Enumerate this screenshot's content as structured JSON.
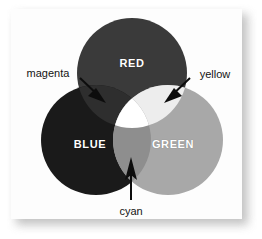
{
  "figure": {
    "background_color": "#ffffff",
    "panel_color": "#fdfdfd",
    "shadow_color": "#b9b9b9",
    "label_text_color": "#ffffff",
    "callout_text_color": "#141414",
    "arrow_color": "#0d0d0d"
  },
  "circles": [
    {
      "name": "red-circle",
      "label": "RED",
      "color": "#3a3a3a",
      "cx": 132,
      "cy": 73,
      "r": 55,
      "label_x": 132,
      "label_y": 63
    },
    {
      "name": "blue-circle",
      "label": "BLUE",
      "color": "#1a1a1a",
      "cx": 96,
      "cy": 140,
      "r": 55,
      "label_x": 90,
      "label_y": 144
    },
    {
      "name": "green-circle",
      "label": "GREEN",
      "color": "#a8a8a8",
      "cx": 168,
      "cy": 140,
      "r": 55,
      "label_x": 173,
      "label_y": 144
    }
  ],
  "overlaps": [
    {
      "name": "magenta-overlap",
      "label": "magenta",
      "components": [
        "RED",
        "BLUE"
      ],
      "color": "#2e2e2e",
      "label_x": 48,
      "label_y": 73
    },
    {
      "name": "yellow-overlap",
      "label": "yellow",
      "components": [
        "RED",
        "GREEN"
      ],
      "color": "#ededed",
      "label_x": 215,
      "label_y": 74
    },
    {
      "name": "cyan-overlap",
      "label": "cyan",
      "components": [
        "BLUE",
        "GREEN"
      ],
      "color": "#8e8e8e",
      "label_x": 131,
      "label_y": 211
    },
    {
      "name": "center-overlap",
      "label": "",
      "components": [
        "RED",
        "GREEN",
        "BLUE"
      ],
      "color": "#ffffff",
      "label_x": 0,
      "label_y": 0
    }
  ],
  "callouts": [
    {
      "name": "magenta-callout",
      "label": "magenta",
      "from_x": 80,
      "from_y": 78,
      "to_x": 102,
      "to_y": 99
    },
    {
      "name": "yellow-callout",
      "label": "yellow",
      "from_x": 190,
      "from_y": 78,
      "to_x": 167,
      "to_y": 99
    },
    {
      "name": "cyan-callout",
      "label": "cyan",
      "from_x": 131,
      "from_y": 200,
      "to_x": 131,
      "to_y": 160
    }
  ]
}
